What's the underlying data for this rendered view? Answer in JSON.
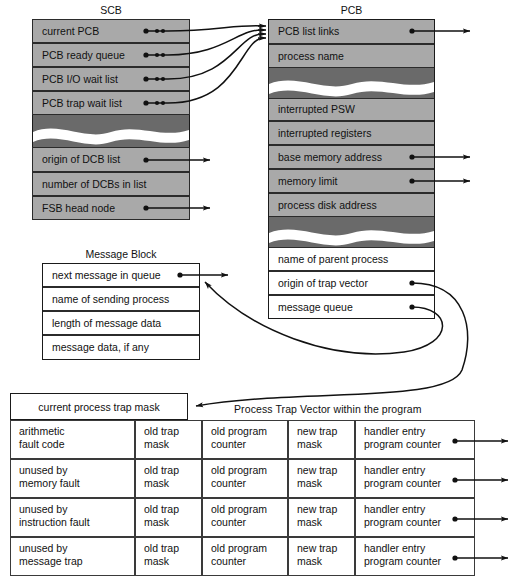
{
  "figure": {
    "scb": {
      "title": "SCB",
      "rows_top": [
        "current PCB",
        "PCB ready queue",
        "PCB I/O wait list",
        "PCB trap wait list"
      ],
      "rows_bottom": [
        "origin of DCB list",
        "number of DCBs in list",
        "FSB head node"
      ]
    },
    "pcb": {
      "title": "PCB",
      "rows_top": [
        "PCB list links",
        "process name"
      ],
      "rows_mid": [
        "interrupted PSW",
        "interrupted registers",
        "base memory address",
        "memory limit",
        "process disk address"
      ],
      "rows_bottom": [
        "name of parent process",
        "origin of trap vector",
        "message queue"
      ]
    },
    "message_block": {
      "title": "Message Block",
      "rows": [
        "next message in queue",
        "name of sending process",
        "length of message data",
        "message data, if any"
      ]
    },
    "trap_table": {
      "mask_label": "current process trap mask",
      "vector_title": "Process Trap Vector within the program",
      "rows": [
        {
          "cause": [
            "arithmetic",
            "fault code"
          ],
          "old_mask": [
            "old trap",
            "mask"
          ],
          "old_pc": [
            "old program",
            "counter"
          ],
          "new_mask": [
            "new trap",
            "mask"
          ],
          "handler": [
            "handler entry",
            "program counter"
          ]
        },
        {
          "cause": [
            "unused by",
            "memory fault"
          ],
          "old_mask": [
            "old trap",
            "mask"
          ],
          "old_pc": [
            "old program",
            "counter"
          ],
          "new_mask": [
            "new trap",
            "mask"
          ],
          "handler": [
            "handler entry",
            "program counter"
          ]
        },
        {
          "cause": [
            "unused by",
            "instruction fault"
          ],
          "old_mask": [
            "old trap",
            "mask"
          ],
          "old_pc": [
            "old program",
            "counter"
          ],
          "new_mask": [
            "new trap",
            "mask"
          ],
          "handler": [
            "handler entry",
            "program counter"
          ]
        },
        {
          "cause": [
            "unused by",
            "message trap"
          ],
          "old_mask": [
            "old trap",
            "mask"
          ],
          "old_pc": [
            "old program",
            "counter"
          ],
          "new_mask": [
            "new trap",
            "mask"
          ],
          "handler": [
            "handler entry",
            "program counter"
          ]
        }
      ]
    },
    "colors": {
      "field_gray": "#a9a9a9",
      "break_dark": "#6a6a6a",
      "field_white": "#ffffff",
      "line": "#1a1a1a"
    }
  }
}
